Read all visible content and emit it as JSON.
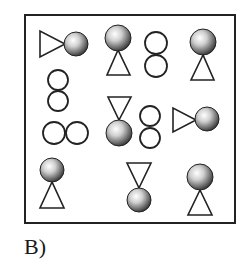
{
  "figure": {
    "label": "B)",
    "frame": {
      "x": 25,
      "y": 15,
      "width": 210,
      "height": 208
    },
    "items": [
      {
        "type": "ball-triangle",
        "orientation": "triangle-left-pointing-right",
        "ball": [
          76,
          44,
          12
        ],
        "tri": [
          [
            40,
            31
          ],
          [
            40,
            57
          ],
          [
            65,
            44
          ]
        ]
      },
      {
        "type": "ball-triangle",
        "orientation": "ball-top-triangle-below",
        "ball": [
          118,
          38,
          13
        ],
        "tri": [
          [
            118,
            50
          ],
          [
            107,
            75
          ],
          [
            130,
            75
          ]
        ]
      },
      {
        "type": "figure-eight",
        "orientation": "vertical",
        "circles": [
          [
            156,
            43,
            11
          ],
          [
            156,
            66,
            11
          ]
        ]
      },
      {
        "type": "ball-triangle",
        "orientation": "ball-top-triangle-below",
        "ball": [
          203,
          42,
          13
        ],
        "tri": [
          [
            203,
            55
          ],
          [
            191,
            80
          ],
          [
            214,
            80
          ]
        ]
      },
      {
        "type": "figure-eight",
        "orientation": "vertical",
        "circles": [
          [
            58,
            80,
            10
          ],
          [
            58,
            101,
            10
          ]
        ]
      },
      {
        "type": "figure-eight",
        "orientation": "horizontal",
        "circles": [
          [
            54,
            133,
            11
          ],
          [
            77,
            133,
            11
          ]
        ]
      },
      {
        "type": "ball-triangle",
        "orientation": "triangle-top-ball-below",
        "ball": [
          119,
          133,
          13
        ],
        "tri": [
          [
            108,
            97
          ],
          [
            131,
            97
          ],
          [
            119,
            120
          ]
        ]
      },
      {
        "type": "figure-eight",
        "orientation": "vertical",
        "circles": [
          [
            150,
            116,
            10
          ],
          [
            150,
            138,
            10
          ]
        ]
      },
      {
        "type": "ball-triangle",
        "orientation": "triangle-left-pointing-right",
        "ball": [
          207,
          119,
          12
        ],
        "tri": [
          [
            173,
            108
          ],
          [
            173,
            132
          ],
          [
            196,
            120
          ]
        ]
      },
      {
        "type": "ball-triangle",
        "orientation": "ball-top-triangle-below",
        "ball": [
          52,
          170,
          12
        ],
        "tri": [
          [
            52,
            182
          ],
          [
            40,
            208
          ],
          [
            64,
            208
          ]
        ]
      },
      {
        "type": "ball-triangle",
        "orientation": "triangle-top-ball-below",
        "ball": [
          139,
          200,
          12
        ],
        "tri": [
          [
            127,
            163
          ],
          [
            151,
            163
          ],
          [
            139,
            188
          ]
        ]
      },
      {
        "type": "ball-triangle",
        "orientation": "ball-top-triangle-below",
        "ball": [
          200,
          177,
          13
        ],
        "tri": [
          [
            200,
            190
          ],
          [
            188,
            215
          ],
          [
            212,
            215
          ]
        ]
      }
    ]
  }
}
